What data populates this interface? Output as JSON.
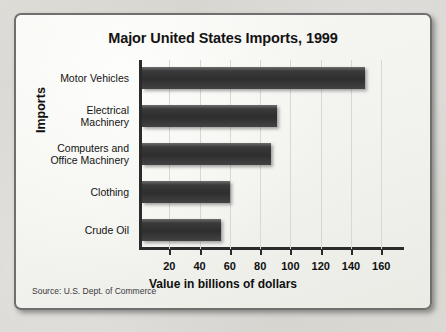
{
  "figure": {
    "title": "Major United States Imports, 1999",
    "source_note": "Source: U.S. Dept. of Commerce"
  },
  "chart_data": {
    "type": "bar",
    "orientation": "horizontal",
    "title": "Major United States Imports, 1999",
    "xlabel": "Value in billions of dollars",
    "ylabel": "Imports",
    "categories": [
      "Motor Vehicles",
      "Electrical Machinery",
      "Computers and Office Machinery",
      "Clothing",
      "Crude Oil"
    ],
    "category_lines": [
      [
        "Motor Vehicles"
      ],
      [
        "Electrical",
        "Machinery"
      ],
      [
        "Computers and",
        "Office Machinery"
      ],
      [
        "Clothing"
      ],
      [
        "Crude Oil"
      ]
    ],
    "values": [
      147,
      89,
      85,
      58,
      52
    ],
    "units": "billions of dollars",
    "xlim": [
      0,
      175
    ],
    "xticks": [
      20,
      40,
      60,
      80,
      100,
      120,
      140,
      160
    ],
    "xtick_labels": [
      "20",
      "40",
      "60",
      "80",
      "100",
      "120",
      "140",
      "160"
    ],
    "grid": "vertical-faint",
    "legend": "none",
    "bar_color": "#333333"
  },
  "colors": {
    "frame_border": "#6f6f6f",
    "paper": "#f4f4f1",
    "axis": "#2b2b2b",
    "gridline": "#d8d8d2",
    "text": "#131313"
  }
}
